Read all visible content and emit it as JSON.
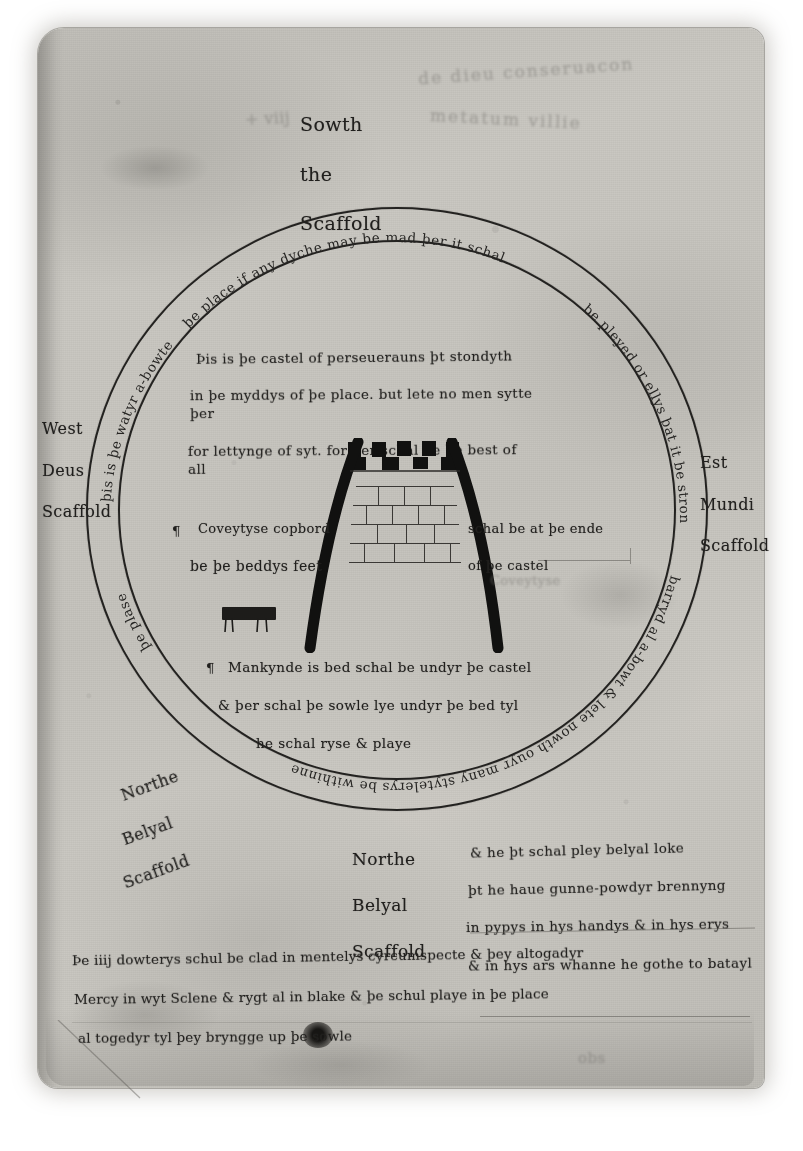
{
  "page": {
    "kind": "manuscript-leaf-photograph",
    "background_color": "#ffffff",
    "parchment_color": "#c5c3bd",
    "ink_color": "#232220"
  },
  "marginalia": {
    "top_left_scribble": "+ viij",
    "top_right_line": "de dieu conseruacon",
    "top_right_line2": "metatum villie",
    "bottom_right_mark": "obs"
  },
  "compass_labels": {
    "south": {
      "line1": "Sowth",
      "line2": "the",
      "line3": "Scaffold"
    },
    "west": {
      "line1": "West",
      "line2": "Deus",
      "line3": "Scaffold"
    },
    "east": {
      "line1": "Est",
      "line2": "Mundi",
      "line3": "Scaffold"
    },
    "north_west": {
      "line1": "Northe",
      "line2": "Belyal",
      "line3": "Scaffold"
    },
    "north": {
      "line1": "Northe",
      "line2": "Belyal",
      "line3": "Scaffold"
    }
  },
  "ring_inscription": {
    "full_text": "Þis is þe watyr a-bowte þe place if any dyche may be mad þer it schal be pleyed or ellys þat it be strongly barryd al a-bowt & lete nowth ouyr many stytelerys be withinne þe plase",
    "segments": {
      "left_up": "þis is þe watyr a-bowte",
      "top": "þe place if any dyche may be mad þer it schal",
      "right_down": "be pleyed or ellys þat it be strongly",
      "bottom": "barryd al a-bowt & lete nowth ouyr many stytelerys be withinne",
      "left_close": "þe plase"
    }
  },
  "inner_notes": {
    "castle_note": {
      "line1": "Þis is þe castel of perseuerauns þt stondyth",
      "line2": "in þe myddys of þe place. but lete no men sytte þer",
      "line3": "for lettynge of syt. for þer schal be þe best of all"
    },
    "left_note": {
      "line1": "Coveytyse copbord",
      "line2": "be þe beddys feet"
    },
    "right_note": {
      "line1": "schal be at þe ende",
      "line2": "of þe castel"
    },
    "bed_note": {
      "line1": "Mankynde is bed schal be undyr þe castel",
      "line2": "& þer schal þe sowle lye undyr þe bed tyl",
      "line3": "he schal ryse & playe"
    }
  },
  "belyal_note": {
    "line1": "& he þt schal pley belyal loke",
    "line2": "þt he haue gunne-powdyr brennyng",
    "line3": "in pypys in hys handys & in hys erys",
    "line4": "& in hys ars whanne he gothe to batayl"
  },
  "bottom_paragraph": {
    "line1": "Þe iiij dowterys schul be clad in mentelys cyrcumspecte & þey altogadyr",
    "line2": "Mercy in wyt Sclene & rygt al in blake & þe schul playe in þe place",
    "line3": "al togedyr tyl þey bryngge up þe sowle"
  },
  "diagram": {
    "castle": {
      "name": "Castle of Perseverance",
      "features": [
        "crenellated battlements",
        "stone masonry courses",
        "two curved buttress legs",
        "bed beneath"
      ]
    },
    "circles": [
      "outer-ditch-circle",
      "inner-ditch-circle"
    ],
    "bed_label": "Mankynde is bed"
  }
}
